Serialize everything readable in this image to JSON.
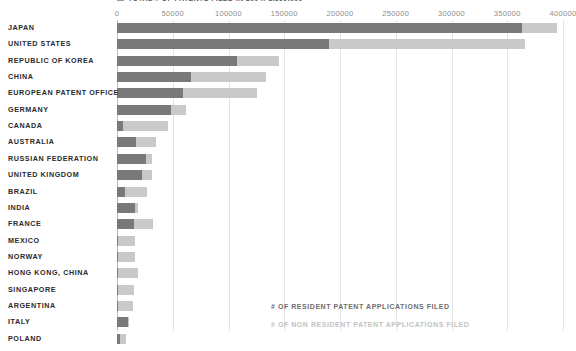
{
  "title": "TOTAL # OF PATENTS FILED IN 2004: 1,599,000",
  "colors": {
    "resident": "#797979",
    "nonresident": "#c9c9c9",
    "grid": "#e4e4e4",
    "axis": "#bdbdbd",
    "label": "#2b2b2b",
    "tick": "#8d8d8d",
    "background": "#ffffff"
  },
  "legend": {
    "resident_label": "# OF RESIDENT PATENT APPLICATIONS FILED",
    "nonresident_label": "# OF NON RESIDENT PATENT APPLICATIONS FILED"
  },
  "chart_data": {
    "type": "bar",
    "orientation": "horizontal",
    "stacked": true,
    "title": "TOTAL # OF PATENTS FILED IN 2004: 1,599,000",
    "xlabel": "",
    "ylabel": "",
    "xlim": [
      0,
      400000
    ],
    "xticks": [
      0,
      50000,
      100000,
      150000,
      200000,
      250000,
      300000,
      350000,
      400000
    ],
    "xticklabels": [
      "0",
      "50000",
      "100000",
      "150000",
      "200000",
      "250000",
      "300000",
      "350000",
      "400000"
    ],
    "grid": true,
    "legend_position": "bottom-center",
    "categories": [
      "JAPAN",
      "UNITED STATES",
      "REPUBLIC OF KOREA",
      "CHINA",
      "EUROPEAN PATENT OFFICE",
      "GERMANY",
      "CANADA",
      "AUSTRALIA",
      "RUSSIAN FEDERATION",
      "UNITED KINGDOM",
      "BRAZIL",
      "INDIA",
      "FRANCE",
      "MEXICO",
      "NORWAY",
      "HONG KONG, CHINA",
      "SINGAPORE",
      "ARGENTINA",
      "ITALY",
      "POLAND"
    ],
    "series": [
      {
        "name": "# OF RESIDENT PATENT APPLICATIONS FILED",
        "color": "#797979",
        "values": [
          363000,
          190000,
          108000,
          66000,
          59000,
          48000,
          5000,
          17000,
          26000,
          22000,
          7000,
          16000,
          15000,
          600,
          1000,
          100,
          600,
          800,
          10000,
          2500
        ]
      },
      {
        "name": "# OF NON RESIDENT PATENT APPLICATIONS FILED",
        "color": "#c9c9c9",
        "values": [
          32000,
          176000,
          37000,
          68000,
          67000,
          14000,
          41000,
          18000,
          5000,
          9000,
          20000,
          3000,
          17000,
          15500,
          15000,
          18000,
          14000,
          13500,
          600,
          5500
        ]
      }
    ]
  }
}
